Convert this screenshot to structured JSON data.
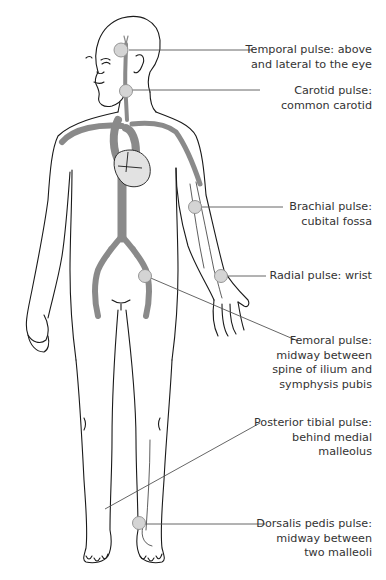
{
  "colors": {
    "outline": "#1a1a1a",
    "artery": "#8a8a8a",
    "pulse_point_fill": "#d4d4d4",
    "pulse_point_stroke": "#8c8c8c",
    "heart_fill": "#e2e2e2",
    "leader_line": "#555555",
    "text": "#333333",
    "background": "#ffffff"
  },
  "pulse_points": [
    {
      "id": "temporal",
      "name": "Temporal pulse",
      "lines": [
        "Temporal pulse: above",
        "and lateral to the eye"
      ]
    },
    {
      "id": "carotid",
      "name": "Carotid pulse",
      "lines": [
        "Carotid pulse:",
        "common carotid"
      ]
    },
    {
      "id": "brachial",
      "name": "Brachial pulse",
      "lines": [
        "Brachial pulse:",
        "cubital fossa"
      ]
    },
    {
      "id": "radial",
      "name": "Radial pulse",
      "lines": [
        "Radial pulse: wrist"
      ]
    },
    {
      "id": "femoral",
      "name": "Femoral pulse",
      "lines": [
        "Femoral pulse:",
        "midway between",
        "spine of ilium and",
        "symphysis pubis"
      ]
    },
    {
      "id": "posterior-tibial",
      "name": "Posterior tibial pulse",
      "lines": [
        "Posterior tibial pulse:",
        "behind medial",
        "malleolus"
      ]
    },
    {
      "id": "dorsalis-pedis",
      "name": "Dorsalis pedis pulse",
      "lines": [
        "Dorsalis pedis pulse:",
        "midway between",
        "two malleoli"
      ]
    }
  ]
}
